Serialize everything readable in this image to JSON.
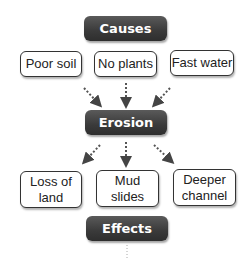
{
  "nodes": {
    "causes": "Causes",
    "erosion": "Erosion",
    "effects": "Effects"
  },
  "causes_list": [
    "Poor soil",
    "No plants",
    "Fast water"
  ],
  "effects_list": [
    {
      "line1": "Loss of",
      "line2": "land"
    },
    {
      "line1": "Mud",
      "line2": "slides"
    },
    {
      "line1": "Deeper",
      "line2": "channel"
    }
  ],
  "colors": {
    "header_bg": "#3a3a3a",
    "box_border": "#333333",
    "text": "#222222"
  }
}
